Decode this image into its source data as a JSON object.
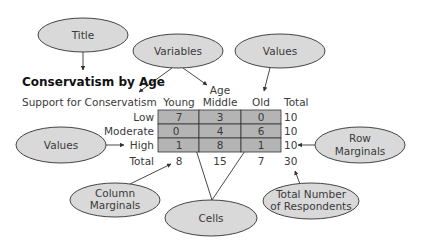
{
  "table": {
    "title": "Conservatism by Age",
    "row_variable": "Support for Conservatism",
    "column_variable": "Age",
    "columns": [
      "Young",
      "Middle",
      "Old"
    ],
    "total_label": "Total",
    "rows": [
      {
        "label": "Low",
        "values": [
          "7",
          "3",
          "0"
        ],
        "total": "10"
      },
      {
        "label": "Moderate",
        "values": [
          "0",
          "4",
          "6"
        ],
        "total": "10"
      },
      {
        "label": "High",
        "values": [
          "1",
          "8",
          "1"
        ],
        "total": "10"
      }
    ],
    "column_totals": [
      "8",
      "15",
      "7"
    ],
    "grand_total": "30"
  },
  "callouts": {
    "title": {
      "lines": [
        "Title"
      ]
    },
    "variables": {
      "lines": [
        "Variables"
      ]
    },
    "values_top": {
      "lines": [
        "Values"
      ]
    },
    "values_left": {
      "lines": [
        "Values"
      ]
    },
    "row_marginals": {
      "lines": [
        "Row",
        "Marginals"
      ]
    },
    "column_marginals": {
      "lines": [
        "Column",
        "Marginals"
      ]
    },
    "cells": {
      "lines": [
        "Cells"
      ]
    },
    "total_respondents": {
      "lines": [
        "Total Number",
        "of Respondents"
      ]
    }
  },
  "colors": {
    "ellipse_fill": "#d9d9d9",
    "cell_fill": "#b4b4b4",
    "outline": "#333333"
  }
}
